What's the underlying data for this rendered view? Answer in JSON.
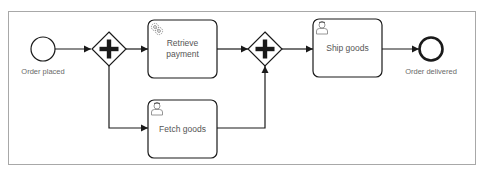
{
  "diagram": {
    "type": "BPMN process",
    "colors": {
      "stroke": "#1a1a1a",
      "label": "#6a6a6a",
      "frame": "#a8a8a8",
      "icon": "#8a8a8a"
    },
    "start_event": {
      "label": "Order placed",
      "icon": "start-event-circle"
    },
    "gateway_split": {
      "type": "parallel",
      "icon": "plus-gateway"
    },
    "tasks": [
      {
        "id": "retrieve_payment",
        "label": "Retrieve payment",
        "type": "service-task",
        "icon": "gears-icon"
      },
      {
        "id": "fetch_goods",
        "label": "Fetch goods",
        "type": "user-task",
        "icon": "user-icon"
      },
      {
        "id": "ship_goods",
        "label": "Ship goods",
        "type": "user-task",
        "icon": "user-icon"
      }
    ],
    "gateway_join": {
      "type": "parallel",
      "icon": "plus-gateway"
    },
    "end_event": {
      "label": "Order delivered",
      "icon": "end-event-circle"
    },
    "flows": [
      [
        "Order placed",
        "parallel split"
      ],
      [
        "parallel split",
        "Retrieve payment"
      ],
      [
        "parallel split",
        "Fetch goods"
      ],
      [
        "Retrieve payment",
        "parallel join"
      ],
      [
        "Fetch goods",
        "parallel join"
      ],
      [
        "parallel join",
        "Ship goods"
      ],
      [
        "Ship goods",
        "Order delivered"
      ]
    ]
  }
}
